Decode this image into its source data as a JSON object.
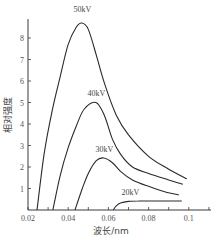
{
  "chart_data": {
    "type": "line",
    "title": "",
    "xlabel": "波长/nm",
    "ylabel": "相对强度",
    "xlim": [
      0.02,
      0.11
    ],
    "ylim": [
      0,
      9
    ],
    "xticks": [
      0.02,
      0.04,
      0.06,
      0.08,
      0.1
    ],
    "xtick_labels": [
      "0.02",
      "0.04",
      "0.06",
      "0.08",
      "0.1"
    ],
    "yticks": [
      1,
      2,
      3,
      4,
      5,
      6,
      7,
      8
    ],
    "ytick_labels": [
      "1",
      "2",
      "3",
      "4",
      "5",
      "6",
      "7",
      "8"
    ],
    "grid": false,
    "legend": "inline labels above peaks",
    "series": [
      {
        "name": "50kV",
        "x": [
          0.0245,
          0.028,
          0.032,
          0.036,
          0.04,
          0.044,
          0.0468,
          0.05,
          0.054,
          0.058,
          0.064,
          0.07,
          0.08,
          0.09,
          0.099
        ],
        "y": [
          0,
          2.6,
          4.6,
          6.2,
          7.7,
          8.5,
          8.7,
          8.4,
          7.2,
          5.9,
          4.4,
          3.5,
          2.5,
          1.9,
          1.45
        ]
      },
      {
        "name": "40kV",
        "x": [
          0.0324,
          0.036,
          0.04,
          0.044,
          0.048,
          0.0538,
          0.058,
          0.062,
          0.066,
          0.072,
          0.08,
          0.09,
          0.097
        ],
        "y": [
          0,
          1.6,
          2.9,
          3.9,
          4.7,
          5.0,
          4.4,
          3.3,
          2.6,
          2.0,
          1.7,
          1.4,
          1.2
        ]
      },
      {
        "name": "30kV",
        "x": [
          0.0434,
          0.047,
          0.05,
          0.054,
          0.0578,
          0.062,
          0.066,
          0.072,
          0.08,
          0.088,
          0.095
        ],
        "y": [
          0,
          1.0,
          1.7,
          2.3,
          2.42,
          2.2,
          1.8,
          1.4,
          1.1,
          0.85,
          0.7
        ]
      },
      {
        "name": "20kV",
        "x": [
          0.0624,
          0.064,
          0.066,
          0.07,
          0.075,
          0.08,
          0.09,
          0.0965
        ],
        "y": [
          0,
          0.2,
          0.32,
          0.4,
          0.42,
          0.42,
          0.42,
          0.42
        ]
      }
    ],
    "annotations": [
      {
        "text": "50kV",
        "x": 0.047,
        "y": 9.2
      },
      {
        "text": "40kV",
        "x": 0.054,
        "y": 5.3
      },
      {
        "text": "30kV",
        "x": 0.058,
        "y": 2.7
      },
      {
        "text": "20kV",
        "x": 0.071,
        "y": 0.7
      }
    ]
  },
  "style": {
    "line_color": "#2a2a2a",
    "axis_color": "#3a3a3a",
    "text_color": "#444444"
  }
}
